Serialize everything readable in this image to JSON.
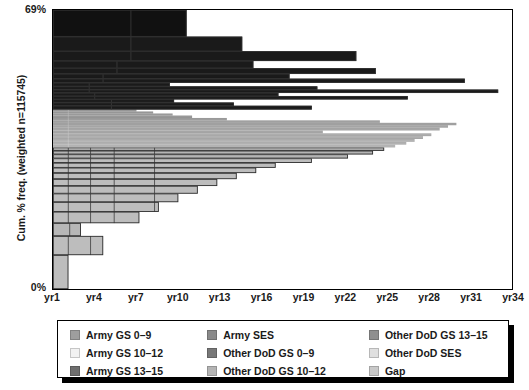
{
  "axes": {
    "y_title": "Cum. % freq. (weighted n=115745)",
    "y_ticks": [
      "69%",
      "0%"
    ],
    "x_ticks": [
      "yr1",
      "yr4",
      "yr7",
      "yr10",
      "yr13",
      "yr16",
      "yr19",
      "yr22",
      "yr25",
      "yr28",
      "yr31",
      "yr34"
    ]
  },
  "legend": {
    "columns": [
      [
        {
          "label": "Army GS 0–9",
          "color": "#9e9e9e"
        },
        {
          "label": "Army GS 10–12",
          "color": "#f2f2f2"
        },
        {
          "label": "Army GS 13–15",
          "color": "#6e6e6e"
        }
      ],
      [
        {
          "label": "Army SES",
          "color": "#8a8a8a"
        },
        {
          "label": "Other DoD GS 0–9",
          "color": "#787878"
        },
        {
          "label": "Other DoD GS 10–12",
          "color": "#b4b4b4"
        }
      ],
      [
        {
          "label": "Other DoD GS 13–15",
          "color": "#8f8f8f"
        },
        {
          "label": "Other DoD SES",
          "color": "#e0e0e0"
        },
        {
          "label": "Gap",
          "color": "#c9c9c9"
        }
      ]
    ]
  },
  "chart_data": {
    "type": "bar",
    "orientation": "horizontal",
    "stacked": true,
    "title": "",
    "xlabel": "",
    "ylabel": "Cum. % freq. (weighted n=115745)",
    "xlim": [
      1,
      34
    ],
    "ylim": [
      0,
      69
    ],
    "x_tick_values": [
      1,
      4,
      7,
      10,
      13,
      16,
      19,
      22,
      25,
      28,
      31,
      34
    ],
    "x_tick_labels": [
      "yr1",
      "yr4",
      "yr7",
      "yr10",
      "yr13",
      "yr16",
      "yr19",
      "yr22",
      "yr25",
      "yr28",
      "yr31",
      "yr34"
    ],
    "y_tick_values": [
      0,
      69
    ],
    "y_tick_labels": [
      "0%",
      "69%"
    ],
    "grid": false,
    "series_names": [
      "Army GS 0–9",
      "Army GS 10–12",
      "Army GS 13–15",
      "Army SES",
      "Other DoD GS 0–9",
      "Other DoD GS 10–12",
      "Other DoD GS 13–15",
      "Other DoD SES",
      "Gap"
    ],
    "series_colors": [
      "#9e9e9e",
      "#f2f2f2",
      "#6e6e6e",
      "#8a8a8a",
      "#787878",
      "#b4b4b4",
      "#8f8f8f",
      "#e0e0e0",
      "#c9c9c9"
    ],
    "note": "Each row is one career path; row height = cumulative % frequency share, row length = total years of career (x value where bar ends). Rows ordered by decreasing height from bottom (0%) to top (69%).",
    "rows": [
      {
        "y0": 0.0,
        "y1": 8.4,
        "x_end": 2.1,
        "fill": "#bdbdbd",
        "segments": [
          1.2,
          0.9
        ]
      },
      {
        "y0": 8.4,
        "y1": 13.1,
        "x_end": 4.6,
        "fill": "#bdbdbd",
        "segments": [
          1.1,
          1.6,
          1.9
        ]
      },
      {
        "y0": 13.1,
        "y1": 16.3,
        "x_end": 3.0,
        "fill": "#b7b7b7",
        "segments": [
          1.2,
          0.8
        ]
      },
      {
        "y0": 16.3,
        "y1": 19.1,
        "x_end": 7.2,
        "fill": "#bdbdbd",
        "segments": [
          1.1,
          1.6,
          1.7,
          2.8
        ]
      },
      {
        "y0": 19.1,
        "y1": 21.5,
        "x_end": 8.6,
        "fill": "#bdbdbd",
        "segments": [
          1.1,
          1.6,
          1.7,
          2.9,
          1.3
        ]
      },
      {
        "y0": 21.5,
        "y1": 23.6,
        "x_end": 10.0,
        "fill": "#bdbdbd",
        "segments": [
          1.1,
          1.6,
          1.7,
          2.9,
          2.7
        ]
      },
      {
        "y0": 23.6,
        "y1": 25.5,
        "x_end": 11.4,
        "fill": "#bdbdbd",
        "segments": [
          1.1,
          1.6,
          1.7,
          2.9,
          4.1
        ]
      },
      {
        "y0": 25.5,
        "y1": 27.2,
        "x_end": 12.8,
        "fill": "#bdbdbd",
        "segments": [
          1.1,
          1.6,
          1.7,
          2.9,
          5.5
        ]
      },
      {
        "y0": 27.2,
        "y1": 28.7,
        "x_end": 14.2,
        "fill": "#bdbdbd",
        "segments": [
          1.1,
          1.6,
          1.7,
          2.9,
          6.9
        ]
      },
      {
        "y0": 28.7,
        "y1": 30.0,
        "x_end": 15.6,
        "fill": "#bdbdbd",
        "segments": [
          1.1,
          1.6,
          1.7,
          2.9,
          8.3
        ]
      },
      {
        "y0": 30.0,
        "y1": 31.2,
        "x_end": 17.0,
        "fill": "#bdbdbd",
        "segments": [
          1.1,
          1.6,
          1.7,
          2.9,
          9.7
        ]
      },
      {
        "y0": 31.2,
        "y1": 32.3,
        "x_end": 19.6,
        "fill": "#bdbdbd",
        "segments": [
          1.1,
          1.6,
          1.7,
          2.9,
          12.3
        ]
      },
      {
        "y0": 32.3,
        "y1": 33.3,
        "x_end": 22.2,
        "fill": "#b4b4b4",
        "segments": [
          1.1,
          1.6,
          1.7,
          2.9,
          14.9
        ]
      },
      {
        "y0": 33.3,
        "y1": 34.2,
        "x_end": 24.0,
        "fill": "#b4b4b4",
        "segments": [
          1.1,
          1.6,
          1.7,
          2.9,
          16.7
        ]
      },
      {
        "y0": 34.2,
        "y1": 35.0,
        "x_end": 24.8,
        "fill": "#b0b0b0",
        "segments": [
          1.1,
          1.6,
          1.7,
          2.9,
          17.5
        ]
      },
      {
        "y0": 35.0,
        "y1": 35.7,
        "x_end": 25.6,
        "fill": "#b0b0b0",
        "segments": [
          1.1,
          1.6,
          1.7,
          2.9,
          18.3
        ]
      },
      {
        "y0": 35.7,
        "y1": 36.4,
        "x_end": 26.4,
        "fill": "#ababab",
        "segments": [
          1.1,
          1.6,
          1.7,
          2.9,
          19.1
        ]
      },
      {
        "y0": 36.4,
        "y1": 37.1,
        "x_end": 27.0,
        "fill": "#ababab",
        "segments": [
          1.1,
          1.6,
          1.7,
          2.9,
          19.7
        ]
      },
      {
        "y0": 37.1,
        "y1": 37.8,
        "x_end": 27.6,
        "fill": "#a6a6a6",
        "segments": [
          1.1,
          1.6,
          1.7,
          2.9,
          20.3
        ]
      },
      {
        "y0": 37.8,
        "y1": 38.5,
        "x_end": 28.2,
        "fill": "#a6a6a6",
        "segments": [
          1.1,
          1.6,
          1.7,
          2.9,
          20.9
        ]
      },
      {
        "y0": 38.5,
        "y1": 39.2,
        "x_end": 20.4,
        "fill": "#a0a0a0",
        "segments": [
          1.1,
          1.6,
          1.7,
          2.9,
          13.1
        ]
      },
      {
        "y0": 39.2,
        "y1": 39.9,
        "x_end": 28.8,
        "fill": "#a0a0a0",
        "segments": [
          1.1,
          1.6,
          1.7,
          2.9,
          21.5
        ]
      },
      {
        "y0": 39.9,
        "y1": 40.5,
        "x_end": 29.4,
        "fill": "#9b9b9b",
        "segments": [
          1.1,
          1.6,
          1.7,
          2.9,
          22.1
        ]
      },
      {
        "y0": 40.5,
        "y1": 41.1,
        "x_end": 30.0,
        "fill": "#9b9b9b",
        "segments": [
          1.1,
          1.6,
          1.7,
          2.9,
          22.7
        ]
      },
      {
        "y0": 41.1,
        "y1": 41.7,
        "x_end": 24.5,
        "fill": "#969696",
        "segments": [
          1.1,
          1.6,
          1.7,
          2.9,
          17.2
        ]
      },
      {
        "y0": 41.7,
        "y1": 42.3,
        "x_end": 13.5,
        "fill": "#969696",
        "segments": [
          1.1,
          1.6,
          1.7,
          2.9,
          6.2
        ]
      },
      {
        "y0": 42.3,
        "y1": 42.9,
        "x_end": 11.0,
        "fill": "#8f8f8f",
        "segments": [
          1.1,
          1.6,
          1.7,
          2.9,
          3.7
        ]
      },
      {
        "y0": 42.9,
        "y1": 43.4,
        "x_end": 9.6,
        "fill": "#8f8f8f",
        "segments": [
          1.1,
          1.6,
          1.7,
          2.9,
          2.3
        ]
      },
      {
        "y0": 43.4,
        "y1": 43.9,
        "x_end": 8.2,
        "fill": "#8a8a8a",
        "segments": [
          1.1,
          1.6,
          1.7,
          2.9,
          0.9
        ]
      },
      {
        "y0": 43.9,
        "y1": 44.4,
        "x_end": 7.0,
        "fill": "#8a8a8a",
        "segments": [
          1.1,
          1.6,
          1.7,
          2.6
        ]
      },
      {
        "y0": 44.4,
        "y1": 45.3,
        "x_end": 19.6,
        "fill": "#1a1a1a",
        "segments": [
          4.2,
          15.4
        ]
      },
      {
        "y0": 45.3,
        "y1": 46.1,
        "x_end": 14.0,
        "fill": "#1a1a1a",
        "segments": [
          4.2,
          9.8
        ]
      },
      {
        "y0": 46.1,
        "y1": 46.9,
        "x_end": 9.7,
        "fill": "#1a1a1a",
        "segments": [
          4.2,
          5.5
        ]
      },
      {
        "y0": 46.9,
        "y1": 47.7,
        "x_end": 26.5,
        "fill": "#1a1a1a",
        "segments": [
          3.0,
          23.5
        ]
      },
      {
        "y0": 47.7,
        "y1": 48.5,
        "x_end": 17.2,
        "fill": "#1a1a1a",
        "segments": [
          3.0,
          14.2
        ]
      },
      {
        "y0": 48.5,
        "y1": 49.3,
        "x_end": 33.0,
        "fill": "#1a1a1a",
        "segments": [
          2.6,
          30.4
        ]
      },
      {
        "y0": 49.3,
        "y1": 50.1,
        "x_end": 20.0,
        "fill": "#1a1a1a",
        "segments": [
          2.6,
          17.4
        ]
      },
      {
        "y0": 50.1,
        "y1": 51.0,
        "x_end": 9.4,
        "fill": "#1a1a1a",
        "segments": [
          2.6,
          6.8
        ]
      },
      {
        "y0": 51.0,
        "y1": 52.0,
        "x_end": 30.6,
        "fill": "#1a1a1a",
        "segments": [
          3.6,
          27.0
        ]
      },
      {
        "y0": 52.0,
        "y1": 53.2,
        "x_end": 18.0,
        "fill": "#1a1a1a",
        "segments": [
          3.6,
          14.4
        ]
      },
      {
        "y0": 53.2,
        "y1": 54.6,
        "x_end": 24.2,
        "fill": "#1a1a1a",
        "segments": [
          4.6,
          19.6
        ]
      },
      {
        "y0": 54.6,
        "y1": 56.4,
        "x_end": 15.4,
        "fill": "#1a1a1a",
        "segments": [
          4.6,
          10.8
        ]
      },
      {
        "y0": 56.4,
        "y1": 58.8,
        "x_end": 22.8,
        "fill": "#1a1a1a",
        "segments": [
          5.6,
          17.2
        ]
      },
      {
        "y0": 58.8,
        "y1": 62.4,
        "x_end": 14.6,
        "fill": "#1a1a1a",
        "segments": [
          5.6,
          9.0
        ]
      },
      {
        "y0": 62.4,
        "y1": 69.0,
        "x_end": 10.6,
        "fill": "#111111",
        "segments": [
          5.6,
          5.0
        ]
      }
    ]
  }
}
